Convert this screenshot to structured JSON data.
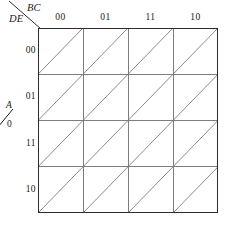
{
  "diagram": {
    "type": "karnaugh-map",
    "corner": {
      "column_variables": "BC",
      "row_variables": "DE",
      "divider_icon": "diagonal-line-icon"
    },
    "group_label": {
      "variable": "A",
      "separator_icon": "slash-icon",
      "value": "0"
    },
    "columns": [
      {
        "label": "00"
      },
      {
        "label": "01"
      },
      {
        "label": "11"
      },
      {
        "label": "10"
      }
    ],
    "rows": [
      {
        "label": "00"
      },
      {
        "label": "01"
      },
      {
        "label": "11"
      },
      {
        "label": "10"
      }
    ],
    "cells": {
      "split_icon": "diagonal-split-icon",
      "split_direction": "bottom-left-to-top-right",
      "contents": [
        [
          "",
          "",
          "",
          ""
        ],
        [
          "",
          "",
          "",
          ""
        ],
        [
          "",
          "",
          "",
          ""
        ],
        [
          "",
          "",
          "",
          ""
        ]
      ]
    },
    "geometry": {
      "grid_left": 38,
      "grid_top": 28,
      "cell_width": 45,
      "cell_height": 46.25,
      "columns_count": 4,
      "rows_count": 4
    },
    "colors": {
      "border": "#2b2b2b",
      "grid_line": "#6f6f6f",
      "diagonal": "#7d7d7d",
      "text": "#1a1a1a",
      "background": "#ffffff"
    }
  }
}
